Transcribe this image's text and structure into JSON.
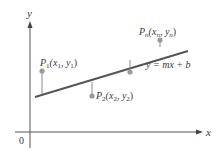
{
  "diagram": {
    "type": "least-squares-regression-line",
    "axes": {
      "x_label": "x",
      "y_label": "y",
      "origin_label": "0"
    },
    "line": {
      "equation_label": "y = mx + b",
      "start": [
        35,
        97
      ],
      "end": [
        188,
        51
      ],
      "color": "#555555"
    },
    "points": [
      {
        "id": "P1",
        "label": "P",
        "sub": "1",
        "coords_label": "(x",
        "coords_sub1": "1",
        "sep": ", y",
        "coords_sub2": "1",
        "close": ")",
        "px": [
          42,
          71
        ],
        "line_y": 94
      },
      {
        "id": "P2",
        "label": "P",
        "sub": "2",
        "coords_label": "(x",
        "coords_sub1": "2",
        "sep": ", y",
        "coords_sub2": "2",
        "close": ")",
        "px": [
          92,
          96
        ],
        "line_y": 82
      },
      {
        "id": "P3",
        "label": "",
        "px": [
          130,
          72
        ],
        "line_y": 60
      },
      {
        "id": "Pn",
        "label": "P",
        "sub": "n",
        "coords_label": "(x",
        "coords_sub1": "n",
        "sep": ", y",
        "coords_sub2": "n",
        "close": ")",
        "px": [
          160,
          40
        ],
        "line_y": 47
      }
    ],
    "colors": {
      "axis": "#555555",
      "point": "#9a9a9a",
      "segment": "#8a8a8a",
      "text": "#3a3a3a"
    }
  }
}
